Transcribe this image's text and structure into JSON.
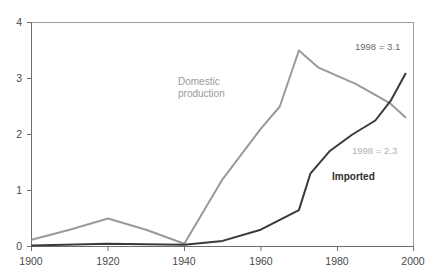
{
  "chart_data": {
    "type": "line",
    "title": "",
    "xlabel": "",
    "ylabel": "",
    "xlim": [
      1900,
      2000
    ],
    "ylim": [
      0,
      4
    ],
    "xticks": [
      "1900",
      "1920",
      "1940",
      "1960",
      "1980",
      "2000"
    ],
    "yticks": [
      "0",
      "1",
      "2",
      "3",
      "4"
    ],
    "grid": false,
    "legend_position": "inline-annotation",
    "series": [
      {
        "name": "Domestic production",
        "color": "#9a9a9a",
        "x": [
          1900,
          1910,
          1920,
          1930,
          1940,
          1950,
          1960,
          1965,
          1970,
          1975,
          1985,
          1994,
          1998
        ],
        "values": [
          0.12,
          0.3,
          0.5,
          0.3,
          0.05,
          1.2,
          2.1,
          2.5,
          3.5,
          3.2,
          2.9,
          2.55,
          2.3
        ]
      },
      {
        "name": "Imported",
        "color": "#3a3a3a",
        "x": [
          1900,
          1920,
          1940,
          1950,
          1960,
          1970,
          1973,
          1978,
          1984,
          1990,
          1994,
          1998
        ],
        "values": [
          0.02,
          0.05,
          0.03,
          0.1,
          0.3,
          0.65,
          1.3,
          1.7,
          2.0,
          2.25,
          2.6,
          3.1
        ]
      }
    ],
    "annotations": [
      {
        "id": "imported-end",
        "text": "1998 = 3.1",
        "color": "#6b6b6b",
        "series": "Imported"
      },
      {
        "id": "domestic-end",
        "text": "1998 = 2.3",
        "color": "#b0b0b0",
        "series": "Domestic production"
      }
    ],
    "series_labels": [
      {
        "id": "domestic",
        "text": "Domestic\nproduction",
        "color": "#9a9a9a"
      },
      {
        "id": "imported",
        "text": "Imported",
        "color": "#2e2e2e"
      }
    ]
  },
  "axis": {
    "y": {
      "t0": "0",
      "t1": "1",
      "t2": "2",
      "t3": "3",
      "t4": "4"
    },
    "x": {
      "t0": "1900",
      "t1": "1920",
      "t2": "1940",
      "t3": "1960",
      "t4": "1980",
      "t5": "2000"
    }
  }
}
